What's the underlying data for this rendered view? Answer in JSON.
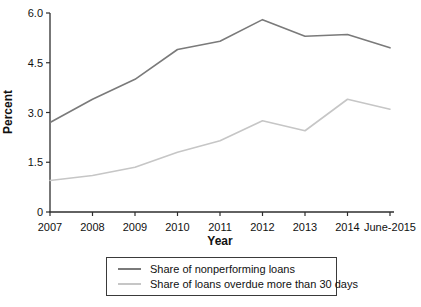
{
  "chart_data": {
    "type": "line",
    "title": "",
    "xlabel": "Year",
    "ylabel": "Percent",
    "categories": [
      "2007",
      "2008",
      "2009",
      "2010",
      "2011",
      "2012",
      "2013",
      "2014",
      "June-2015"
    ],
    "y_ticks": [
      0,
      1.5,
      3.0,
      4.5,
      6.0
    ],
    "y_tick_labels": [
      "0",
      "1.5",
      "3.0",
      "4.5",
      "6.0"
    ],
    "ylim": [
      0,
      6.0
    ],
    "grid": false,
    "legend_position": "bottom",
    "axis_color": "#2e2e2e",
    "series": [
      {
        "name": "Share of nonperforming loans",
        "color": "#7a7a7a",
        "values": [
          2.7,
          3.4,
          4.0,
          4.9,
          5.15,
          5.8,
          5.3,
          5.35,
          4.95
        ]
      },
      {
        "name": "Share of loans overdue more than 30 days",
        "color": "#c6c6c6",
        "values": [
          0.95,
          1.1,
          1.35,
          1.8,
          2.15,
          2.75,
          2.45,
          3.4,
          3.1
        ]
      }
    ]
  }
}
